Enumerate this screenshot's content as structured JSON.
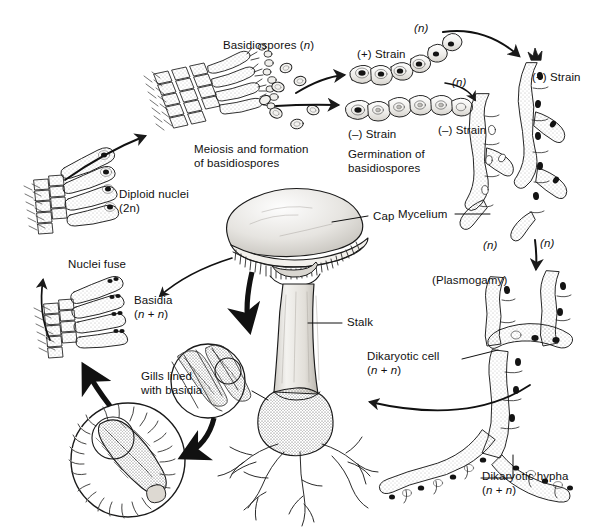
{
  "figure": {
    "background_color": "#ffffff",
    "ink_color": "#1a1a1a",
    "width": 594,
    "height": 532
  },
  "labels": {
    "basidiospores": "Basidiospores (n)",
    "plus_strain_top": "(+) Strain",
    "n_top_right": "(n)",
    "n_mid_right": "(n)",
    "plus_strain_right": "(+) Strain",
    "minus_strain_germ": "(–) Strain",
    "germination": "Germination of\nbasidiospores",
    "minus_strain_mycelium": "(–) Strain",
    "mycelium": "Mycelium",
    "n_left_bottom": "(n)",
    "n_right_bottom": "(n)",
    "plasmogamy": "(Plasmogamy)",
    "dikaryotic_cell": "Dikaryotic cell\n(n + n)",
    "dikaryotic_hypha": "Dikaryotic hypha\n(n + n)",
    "meiosis": "Meiosis and formation\nof basidiospores",
    "diploid_nuclei": "Diploid nuclei\n(2n)",
    "nuclei_fuse": "Nuclei fuse",
    "basidia": "Basidia\n(n + n)",
    "gills_lined": "Gills lined\nwith basidia",
    "cap": "Cap",
    "stalk": "Stalk"
  },
  "structures": [
    {
      "name": "basidia-cluster-meiosis",
      "description": "club-shaped basidia on gill tissue releasing basidiospores"
    },
    {
      "name": "basidiospore-cluster",
      "description": "scattered oval haploid spores"
    },
    {
      "name": "plus-strain-hypha",
      "description": "germinated haploid hypha, plus mating type"
    },
    {
      "name": "minus-strain-hypha",
      "description": "germinated haploid hypha, minus mating type"
    },
    {
      "name": "mycelium-network",
      "description": "branching haploid mycelium, (n)"
    },
    {
      "name": "plasmogamy-junction",
      "description": "fusion of (+) and (–) hyphae forming dikaryotic cell"
    },
    {
      "name": "dikaryotic-hypha-chain",
      "description": "branching hypha with paired nuclei (n+n)"
    },
    {
      "name": "mushroom-basidiocarp",
      "description": "mature mushroom with cap, gills, stalk, bulb and rhizomorphs"
    },
    {
      "name": "gill-cross-section-inset",
      "description": "circular inset of gill tissue lined with basidia"
    },
    {
      "name": "basidium-closeup-inset",
      "description": "large circular inset of a single basidium"
    },
    {
      "name": "basidia-dikaryotic",
      "description": "basidia with two nuclei per cell (n+n)"
    },
    {
      "name": "basidia-diploid",
      "description": "basidia after nuclear fusion, diploid (2n)"
    }
  ],
  "arrows": [
    {
      "name": "arrow-basidiospores-to-plus",
      "from": "basidiospore-cluster",
      "to": "plus-strain-hypha"
    },
    {
      "name": "arrow-basidiospores-to-minus",
      "from": "basidiospore-cluster",
      "to": "minus-strain-hypha"
    },
    {
      "name": "arrow-plus-to-mycelium",
      "from": "plus-strain-hypha",
      "to": "mycelium-plus"
    },
    {
      "name": "arrow-minus-to-mycelium",
      "from": "minus-strain-hypha",
      "to": "mycelium-minus"
    },
    {
      "name": "arrow-mycelium-to-plasmogamy",
      "from": "mycelium-network",
      "to": "plasmogamy-junction"
    },
    {
      "name": "arrow-dikaryotic-to-mushroom",
      "from": "dikaryotic-hypha-chain",
      "to": "mushroom-basidiocarp"
    },
    {
      "name": "arrow-mushroom-to-gill-inset",
      "from": "mushroom-basidiocarp",
      "to": "gill-cross-section-inset"
    },
    {
      "name": "arrow-gill-inset-to-basidium-inset",
      "from": "gill-cross-section-inset",
      "to": "basidium-closeup-inset"
    },
    {
      "name": "arrow-basidium-inset-to-basidia",
      "from": "basidium-closeup-inset",
      "to": "basidia-dikaryotic"
    },
    {
      "name": "arrow-mushroom-to-basidia",
      "from": "mushroom-basidiocarp",
      "to": "basidia-dikaryotic"
    },
    {
      "name": "arrow-nuclei-fuse",
      "from": "basidia-dikaryotic",
      "to": "basidia-diploid"
    },
    {
      "name": "arrow-diploid-to-meiosis",
      "from": "basidia-diploid",
      "to": "basidia-cluster-meiosis"
    }
  ]
}
